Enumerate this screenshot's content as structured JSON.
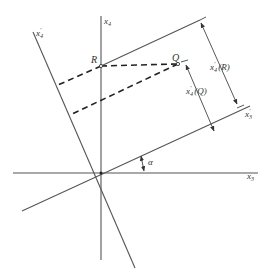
{
  "diagram": {
    "title": "",
    "labels": {
      "x3": "x",
      "x3_sub": "3",
      "x4": "x",
      "x4_sub": "4",
      "x3_prime": "x",
      "x3_prime_sub": "3",
      "x3_prime_mark": "'",
      "x4_prime": "x",
      "x4_prime_sub": "4",
      "x4_prime_mark": "'",
      "point_R": "R",
      "point_Q": "Q",
      "angle": "α",
      "dim_R": "(R)",
      "dim_Q": "(Q)"
    },
    "points": {
      "origin": [
        101,
        173
      ],
      "R": [
        101,
        66
      ],
      "Q": [
        178,
        64
      ]
    },
    "angle_alpha_deg": 25,
    "colors": {
      "line": "#555555",
      "dashed": "#222222",
      "text": "#333333"
    }
  }
}
